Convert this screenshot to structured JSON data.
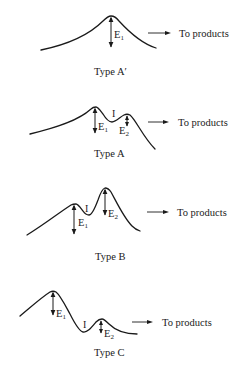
{
  "figure": {
    "panels": [
      {
        "type_label": "Type A′",
        "energy_labels": {
          "e1": "E",
          "e1_sub": "1"
        },
        "product_label": "To products"
      },
      {
        "type_label": "Type A",
        "intermediate_label": "I",
        "energy_labels": {
          "e1": "E",
          "e1_sub": "1",
          "e2": "E",
          "e2_sub": "2"
        },
        "product_label": "To products"
      },
      {
        "type_label": "Type B",
        "intermediate_label": "I",
        "energy_labels": {
          "e1": "E",
          "e1_sub": "1",
          "e2": "E",
          "e2_sub": "2"
        },
        "product_label": "To products"
      },
      {
        "type_label": "Type C",
        "intermediate_label": "I",
        "energy_labels": {
          "e1": "E",
          "e1_sub": "1",
          "e2": "E",
          "e2_sub": "2"
        },
        "product_label": "To products"
      }
    ]
  }
}
